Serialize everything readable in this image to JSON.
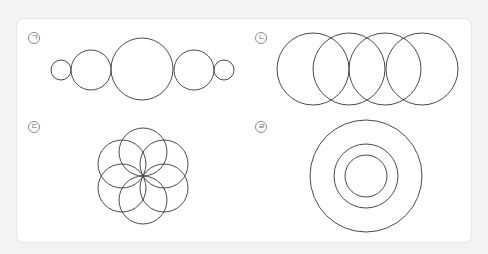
{
  "figures": [
    {
      "id": "a",
      "label": "ㄱ",
      "description": "Five circles in a row, tangent to each other, sized small-medium-large-medium-small",
      "circles": [
        {
          "cx": 61,
          "cy": 70,
          "r": 10
        },
        {
          "cx": 91,
          "cy": 70,
          "r": 20
        },
        {
          "cx": 142,
          "cy": 69,
          "r": 31
        },
        {
          "cx": 194,
          "cy": 70,
          "r": 20
        },
        {
          "cx": 224,
          "cy": 70,
          "r": 10
        }
      ]
    },
    {
      "id": "b",
      "label": "ㄴ",
      "description": "Four equal overlapping circles in a horizontal row",
      "circles": [
        {
          "cx": 313,
          "cy": 69,
          "r": 36
        },
        {
          "cx": 349,
          "cy": 69,
          "r": 36
        },
        {
          "cx": 385,
          "cy": 69,
          "r": 36
        },
        {
          "cx": 422,
          "cy": 69,
          "r": 36
        }
      ]
    },
    {
      "id": "c",
      "label": "ㄷ",
      "description": "Six equal circles arranged in a flower pattern meeting at a common center",
      "circles": [
        {
          "cx": 143,
          "cy": 152,
          "r": 24
        },
        {
          "cx": 164,
          "cy": 164,
          "r": 24
        },
        {
          "cx": 164,
          "cy": 188,
          "r": 24
        },
        {
          "cx": 143,
          "cy": 200,
          "r": 24
        },
        {
          "cx": 122,
          "cy": 188,
          "r": 24
        },
        {
          "cx": 122,
          "cy": 164,
          "r": 24
        }
      ]
    },
    {
      "id": "d",
      "label": "ㄹ",
      "description": "Three concentric circles",
      "circles": [
        {
          "cx": 366,
          "cy": 176,
          "r": 56
        },
        {
          "cx": 366,
          "cy": 176,
          "r": 32
        },
        {
          "cx": 366,
          "cy": 176,
          "r": 21
        }
      ]
    }
  ],
  "labels": {
    "a": "ㄱ",
    "b": "ㄴ",
    "c": "ㄷ",
    "d": "ㄹ"
  },
  "colors": {
    "stroke": "#4a4a4a",
    "panel_bg": "#ffffff",
    "page_bg": "#f3f3f3"
  }
}
